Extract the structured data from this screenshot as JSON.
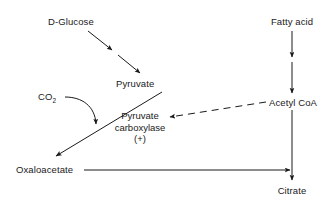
{
  "diagram": {
    "background_color": "#ffffff",
    "line_color": "#1a1a1a",
    "text_color": "#1a1a1a",
    "nodes": {
      "d_glucose": "D-Glucose",
      "pyruvate": "Pyruvate",
      "oxaloacetate": "Oxaloacetate",
      "co2_formula": "CO",
      "co2_subscript": "2",
      "fatty_acid": "Fatty acid",
      "acetyl_coa": "Acetyl CoA",
      "citrate": "Citrate"
    },
    "enzyme": {
      "line1": "Pyruvate",
      "line2": "carboxylase",
      "line3": "(+)"
    },
    "edges": [
      {
        "name": "glucose-to-pyruvate",
        "from": "D-Glucose",
        "to": "Pyruvate",
        "style": "solid-double-arrow"
      },
      {
        "name": "co2-to-pyruvate-reaction",
        "from": "CO2",
        "to": "Pyruvate carboxylase reaction",
        "style": "curved-solid-arrow"
      },
      {
        "name": "pyruvate-to-oxaloacetate",
        "from": "Pyruvate",
        "to": "Oxaloacetate",
        "style": "solid-arrow"
      },
      {
        "name": "fatty-acid-to-acetyl-coa",
        "from": "Fatty acid",
        "to": "Acetyl CoA",
        "style": "solid-double-arrow"
      },
      {
        "name": "acetyl-coa-activates-pyruvate-carboxylase",
        "from": "Acetyl CoA",
        "to": "Pyruvate carboxylase",
        "style": "dashed-arrow"
      },
      {
        "name": "oxaloacetate-to-citrate",
        "from": "Oxaloacetate",
        "to": "Citrate",
        "style": "solid-arrow"
      },
      {
        "name": "acetyl-coa-to-citrate",
        "from": "Acetyl CoA",
        "to": "Citrate",
        "style": "solid-arrow"
      }
    ]
  }
}
